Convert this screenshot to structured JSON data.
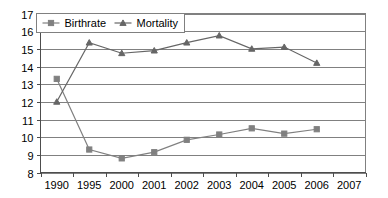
{
  "chart_data": {
    "type": "line",
    "title": "",
    "xlabel": "",
    "ylabel": "",
    "categories": [
      "1990",
      "1995",
      "2000",
      "2001",
      "2002",
      "2003",
      "2004",
      "2005",
      "2006",
      "2007"
    ],
    "ylim": [
      8,
      17
    ],
    "y_ticks": [
      "8",
      "9",
      "10",
      "11",
      "12",
      "13",
      "14",
      "15",
      "16",
      "17"
    ],
    "grid": true,
    "legend_position": "top-left-inside",
    "series": [
      {
        "name": "Birthrate",
        "marker": "square",
        "color": "#808080",
        "values": [
          13.3,
          9.3,
          8.8,
          9.15,
          9.85,
          10.15,
          10.5,
          10.2,
          10.45,
          null
        ]
      },
      {
        "name": "Mortality",
        "marker": "triangle",
        "color": "#666666",
        "values": [
          12.0,
          15.35,
          14.75,
          14.9,
          15.35,
          15.75,
          15.0,
          15.1,
          14.2,
          null
        ]
      }
    ]
  },
  "legend": {
    "items": [
      {
        "label": "Birthrate",
        "marker": "square-marker"
      },
      {
        "label": "Mortality",
        "marker": "triangle-marker"
      }
    ]
  },
  "axes": {
    "y_tick_labels": [
      "17",
      "16",
      "15",
      "14",
      "13",
      "12",
      "11",
      "10",
      "9",
      "8"
    ],
    "x_tick_labels": [
      "1990",
      "1995",
      "2000",
      "2001",
      "2002",
      "2003",
      "2004",
      "2005",
      "2006",
      "2007"
    ]
  }
}
